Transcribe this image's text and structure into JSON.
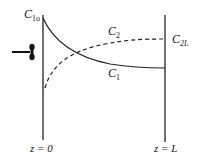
{
  "diagram": {
    "type": "concentration-profile",
    "labels": {
      "c1_inlet": {
        "main": "C",
        "sub": "1o"
      },
      "c2_outlet": {
        "main": "C",
        "sub": "2L"
      },
      "c1_curve": {
        "main": "C",
        "sub": "1"
      },
      "c2_curve": {
        "main": "C",
        "sub": "2"
      },
      "z_start": "z = 0",
      "z_end": "z = L"
    },
    "curves": [
      {
        "name": "C1",
        "style": "solid",
        "trend": "decreasing"
      },
      {
        "name": "C2",
        "style": "dashed",
        "trend": "increasing"
      }
    ],
    "inlet_symbol": "arrow-with-valve"
  }
}
